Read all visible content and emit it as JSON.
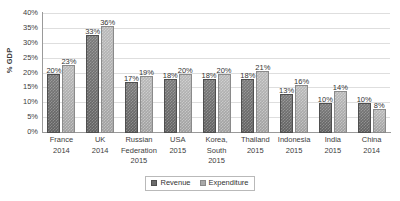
{
  "chart_data": {
    "type": "bar",
    "title": "",
    "xlabel": "",
    "ylabel": "% GDP",
    "ylim": [
      0,
      40
    ],
    "ytick_labels": [
      "40%",
      "35%",
      "30%",
      "25%",
      "20%",
      "15%",
      "10%",
      "5%",
      "0%"
    ],
    "ytick_values": [
      40,
      35,
      30,
      25,
      20,
      15,
      10,
      5,
      0
    ],
    "grid": true,
    "legend_position": "bottom",
    "categories": [
      "France 2014",
      "UK 2014",
      "Russian Federation 2015",
      "USA 2015",
      "Korea, South 2015",
      "Thailand 2015",
      "Indonesia 2015",
      "India 2015",
      "China 2014"
    ],
    "category_lines": [
      [
        "France",
        "2014"
      ],
      [
        "UK",
        "2014"
      ],
      [
        "Russian",
        "Federation",
        "2015"
      ],
      [
        "USA",
        "2015"
      ],
      [
        "Korea,",
        "South",
        "2015"
      ],
      [
        "Thailand",
        "2015"
      ],
      [
        "Indonesia",
        "2015"
      ],
      [
        "India",
        "2015"
      ],
      [
        "China",
        "2014"
      ]
    ],
    "series": [
      {
        "name": "Revenue",
        "color": "#6b6b6b",
        "values": [
          20,
          33,
          17,
          18,
          18,
          18,
          13,
          10,
          10
        ],
        "labels": [
          "20%",
          "33%",
          "17%",
          "18%",
          "18%",
          "18%",
          "13%",
          "10%",
          "10%"
        ]
      },
      {
        "name": "Expenditure",
        "color": "#a9a9a9",
        "values": [
          23,
          36,
          19,
          20,
          20,
          21,
          16,
          14,
          8
        ],
        "labels": [
          "23%",
          "36%",
          "19%",
          "20%",
          "20%",
          "21%",
          "16%",
          "14%",
          "8%"
        ]
      }
    ]
  },
  "legend": {
    "items": [
      {
        "label": "Revenue"
      },
      {
        "label": "Expenditure"
      }
    ]
  }
}
